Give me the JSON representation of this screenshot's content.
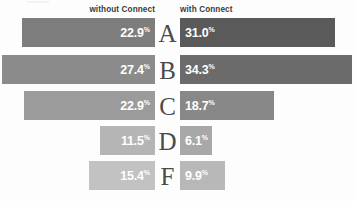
{
  "header": {
    "left_label": "without Connect",
    "right_label": "with Connect"
  },
  "chart_data": {
    "type": "bar",
    "title": "",
    "subtitle": "",
    "orientation": "horizontal",
    "layout": "diverging-tornado",
    "xlabel": "",
    "ylabel": "",
    "grid": false,
    "legend_position": "top",
    "categories": [
      "A",
      "B",
      "C",
      "D",
      "F"
    ],
    "category_label": "Grade",
    "value_suffix": "%",
    "series": [
      {
        "name": "without Connect",
        "side": "left",
        "values": [
          22.9,
          27.4,
          22.9,
          11.5,
          15.4
        ],
        "labels": [
          "22.9",
          "27.4",
          "22.9",
          "11.5",
          "15.4"
        ],
        "colors": [
          "#7d7d7d",
          "#8b8b8b",
          "#9b9b9b",
          "#b5b5b5",
          "#c2c2c2"
        ]
      },
      {
        "name": "with Connect",
        "side": "right",
        "values": [
          31.0,
          34.3,
          18.7,
          6.1,
          9.9
        ],
        "labels": [
          "31.0",
          "34.3",
          "18.7",
          "6.1",
          "9.9"
        ],
        "colors": [
          "#5a5a5a",
          "#6b6b6b",
          "#888888",
          "#a8a8a8",
          "#b8b8b8"
        ]
      }
    ],
    "rows": [
      {
        "grade": "A",
        "left_value": 22.9,
        "left_label": "22.9",
        "left_width_px": 133,
        "left_color": "#7d7d7d",
        "right_value": 31.0,
        "right_label": "31.0",
        "right_width_px": 155,
        "right_color": "#5a5a5a",
        "top_px": 18,
        "height_px": 29
      },
      {
        "grade": "B",
        "left_value": 27.4,
        "left_label": "27.4",
        "left_width_px": 153,
        "left_color": "#8b8b8b",
        "right_value": 34.3,
        "right_label": "34.3",
        "right_width_px": 172,
        "right_color": "#6b6b6b",
        "top_px": 55,
        "height_px": 29
      },
      {
        "grade": "C",
        "left_value": 22.9,
        "left_label": "22.9",
        "left_width_px": 131,
        "left_color": "#9b9b9b",
        "right_value": 18.7,
        "right_label": "18.7",
        "right_width_px": 94,
        "right_color": "#888888",
        "top_px": 91,
        "height_px": 29
      },
      {
        "grade": "D",
        "left_value": 11.5,
        "left_label": "11.5",
        "left_width_px": 55,
        "left_color": "#b5b5b5",
        "right_value": 6.1,
        "right_label": "6.1",
        "right_width_px": 32,
        "right_color": "#a8a8a8",
        "top_px": 126,
        "height_px": 29
      },
      {
        "grade": "F",
        "left_value": 15.4,
        "left_label": "15.4",
        "left_width_px": 66,
        "left_color": "#c2c2c2",
        "right_value": 9.9,
        "right_label": "9.9",
        "right_width_px": 45,
        "right_color": "#b8b8b8",
        "top_px": 161,
        "height_px": 29
      }
    ]
  }
}
